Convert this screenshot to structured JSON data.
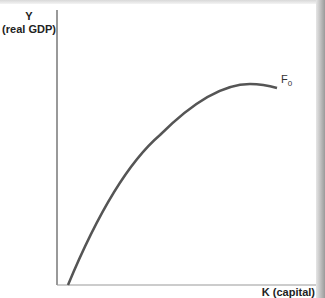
{
  "diagram": {
    "y_axis": {
      "label_line1": "Y",
      "label_line2": "(real GDP)"
    },
    "x_axis": {
      "label": "K (capital)"
    },
    "curve": {
      "label": "F",
      "subscript": "0",
      "color": "#555555"
    },
    "axis_color": "#777777"
  }
}
